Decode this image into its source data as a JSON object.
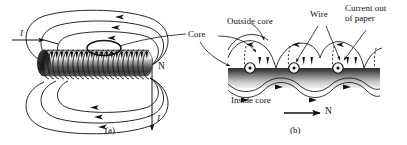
{
  "figure": {
    "background_color": "#ffffff",
    "line_color": "#111111",
    "core_color_dark": "#3a3a3a",
    "core_color_light": "#e8e8e8"
  },
  "panel_a": {
    "caption": "(a)",
    "current_in_label": "I",
    "current_out_label": "I",
    "south_pole_label": "S",
    "north_pole_label": "N",
    "callout_core_label": "Core"
  },
  "panel_b": {
    "caption": "(b)",
    "outside_core_label": "Outside core",
    "inside_core_label": "Inside core",
    "wire_label": "Wire",
    "current_out_of_paper_label": "Current out\nof paper",
    "current_out_of_paper_line1": "Current out",
    "current_out_of_paper_line2": "of paper",
    "north_direction_label": "N"
  }
}
